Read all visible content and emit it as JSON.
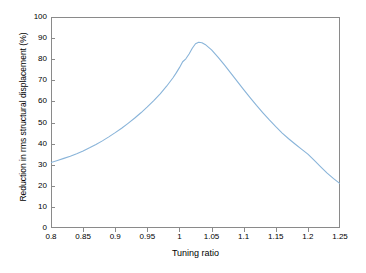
{
  "chart_data": {
    "type": "line",
    "title": "",
    "xlabel": "Tuning ratio",
    "ylabel": "Reduction in rms structural displacement (%)",
    "xlim": [
      0.8,
      1.25
    ],
    "ylim": [
      0,
      100
    ],
    "xticks": [
      "0.8",
      "0.85",
      "0.9",
      "0.95",
      "1",
      "1.05",
      "1.1",
      "1.15",
      "1.2",
      "1.25"
    ],
    "xtick_values": [
      0.8,
      0.85,
      0.9,
      0.95,
      1.0,
      1.05,
      1.1,
      1.15,
      1.2,
      1.25
    ],
    "yticks": [
      "0",
      "10",
      "20",
      "30",
      "40",
      "50",
      "60",
      "70",
      "80",
      "90",
      "100"
    ],
    "ytick_values": [
      0,
      10,
      20,
      30,
      40,
      50,
      60,
      70,
      80,
      90,
      100
    ],
    "grid": false,
    "legend": false,
    "line_color": "#89b4d9",
    "line_width": 1.1,
    "series": [
      {
        "name": "Reduction in rms structural displacement",
        "x": [
          0.8,
          0.81,
          0.82,
          0.83,
          0.84,
          0.85,
          0.86,
          0.87,
          0.88,
          0.89,
          0.9,
          0.91,
          0.92,
          0.93,
          0.94,
          0.95,
          0.96,
          0.97,
          0.98,
          0.99,
          0.995,
          1.0,
          1.005,
          1.01,
          1.015,
          1.02,
          1.025,
          1.03,
          1.035,
          1.04,
          1.05,
          1.06,
          1.07,
          1.08,
          1.09,
          1.1,
          1.11,
          1.12,
          1.13,
          1.14,
          1.15,
          1.16,
          1.17,
          1.18,
          1.19,
          1.2,
          1.21,
          1.22,
          1.23,
          1.24,
          1.25
        ],
        "y": [
          31.0,
          32.0,
          33.0,
          34.0,
          35.2,
          36.5,
          38.0,
          39.6,
          41.3,
          43.2,
          45.2,
          47.3,
          49.6,
          52.0,
          54.6,
          57.4,
          60.4,
          63.6,
          67.2,
          71.2,
          73.5,
          76.0,
          78.8,
          80.2,
          82.5,
          85.2,
          87.3,
          88.0,
          87.8,
          87.0,
          84.4,
          81.0,
          77.3,
          73.4,
          69.5,
          65.6,
          61.8,
          58.1,
          54.6,
          51.2,
          48.0,
          45.0,
          42.3,
          39.8,
          37.4,
          35.0,
          32.0,
          29.0,
          26.0,
          23.4,
          21.0
        ]
      }
    ],
    "peak": {
      "x": 1.03,
      "y": 88.0
    },
    "endpoints": {
      "left": {
        "x": 0.8,
        "y": 31.0
      },
      "right": {
        "x": 1.25,
        "y": 21.0
      }
    }
  }
}
